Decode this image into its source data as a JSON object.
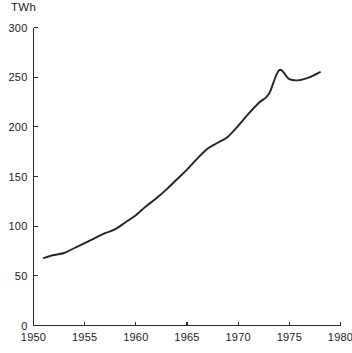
{
  "chart_data": {
    "type": "line",
    "title": "",
    "subtitle": "",
    "xlabel": "",
    "ylabel": "TWh",
    "unit_label": "TWh",
    "xlim": [
      1950,
      1980
    ],
    "ylim": [
      0,
      300
    ],
    "grid": false,
    "legend": false,
    "legend_position": "none",
    "x_ticks": [
      1950,
      1955,
      1960,
      1965,
      1970,
      1975,
      1980
    ],
    "x_tick_labels": [
      "1950",
      "1955",
      "1960",
      "1965",
      "1970",
      "1975",
      "1980"
    ],
    "y_ticks": [
      0,
      50,
      100,
      150,
      200,
      250,
      300
    ],
    "y_tick_labels": [
      "0",
      "50",
      "100",
      "150",
      "200",
      "250",
      "300"
    ],
    "line_color": "#252525",
    "axis_color": "#2b2b2b",
    "background_color": "#ffffff",
    "series": [
      {
        "name": "Electricity production",
        "x": [
          1951,
          1952,
          1953,
          1954,
          1955,
          1956,
          1957,
          1958,
          1959,
          1960,
          1961,
          1962,
          1963,
          1964,
          1965,
          1966,
          1967,
          1968,
          1969,
          1970,
          1971,
          1972,
          1973,
          1974,
          1975,
          1976,
          1977,
          1978
        ],
        "values": [
          68,
          71,
          73,
          78,
          83,
          88,
          93,
          97,
          104,
          111,
          120,
          128,
          137,
          147,
          157,
          168,
          178,
          184,
          190,
          201,
          213,
          224,
          233,
          257,
          248,
          247,
          250,
          255
        ]
      }
    ],
    "annotations": []
  }
}
